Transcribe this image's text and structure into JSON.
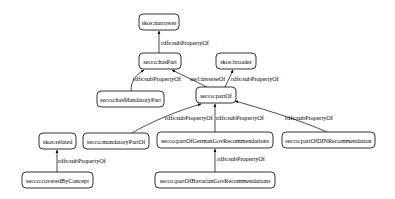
{
  "diagram": {
    "type": "property-hierarchy-graph",
    "nodes": [
      {
        "id": "narrower",
        "label": "skos:narrower",
        "x": 139,
        "y": 14,
        "w": 40,
        "h": 16
      },
      {
        "id": "hasPart",
        "label": "secco:hasPart",
        "x": 139,
        "y": 53,
        "w": 42,
        "h": 16
      },
      {
        "id": "broader",
        "label": "skos:broader",
        "x": 216,
        "y": 53,
        "w": 40,
        "h": 16
      },
      {
        "id": "hasMandatoryPart",
        "label": "secco:hasMandatoryPart",
        "x": 97,
        "y": 91,
        "w": 67,
        "h": 16
      },
      {
        "id": "partOf",
        "label": "secco:partOf",
        "x": 196,
        "y": 87,
        "w": 40,
        "h": 16
      },
      {
        "id": "related",
        "label": "skos:related",
        "x": 39,
        "y": 133,
        "w": 37,
        "h": 16
      },
      {
        "id": "mandatoryPartOf",
        "label": "secco:mandatoryPartOf",
        "x": 83,
        "y": 133,
        "w": 66,
        "h": 16
      },
      {
        "id": "partOfGerman",
        "label": "secco:partOfGermanGovRecommendations",
        "x": 157,
        "y": 132,
        "w": 116,
        "h": 16
      },
      {
        "id": "partOfDIN",
        "label": "secco:partOfDINRecommendation",
        "x": 282,
        "y": 132,
        "w": 93,
        "h": 16
      },
      {
        "id": "coveredByConcept",
        "label": "secco:coveredByConcept",
        "x": 22,
        "y": 172,
        "w": 71,
        "h": 16
      },
      {
        "id": "partOfBavarian",
        "label": "secco:partOfBavarianGovRecommendations",
        "x": 155,
        "y": 172,
        "w": 120,
        "h": 16
      }
    ],
    "edges": [
      {
        "from": "hasPart",
        "to": "narrower",
        "label": "rdfs:subPropertyOf"
      },
      {
        "from": "hasMandatoryPart",
        "to": "hasPart",
        "label": "rdfs:subPropertyOf"
      },
      {
        "from": "partOf",
        "to": "hasPart",
        "label": "owl:inverseOf"
      },
      {
        "from": "partOf",
        "to": "broader",
        "label": "rdfs:subPropertyOf"
      },
      {
        "from": "mandatoryPartOf",
        "to": "partOf",
        "label": "rdfs:subPropertyOf"
      },
      {
        "from": "partOfGerman",
        "to": "partOf",
        "label": "rdfs:subPropertyOf"
      },
      {
        "from": "partOfDIN",
        "to": "partOf",
        "label": "rdfs:subPropertyOf"
      },
      {
        "from": "coveredByConcept",
        "to": "related",
        "label": "rdfs:subPropertyOf"
      },
      {
        "from": "partOfBavarian",
        "to": "partOfGerman",
        "label": "rdfs:subPropertyOf"
      }
    ]
  }
}
